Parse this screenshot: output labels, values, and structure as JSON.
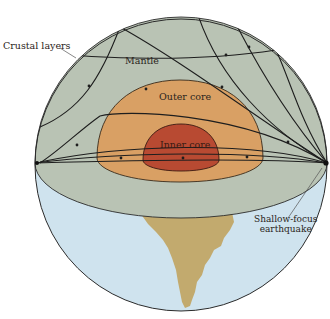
{
  "figure": {
    "labels": {
      "crustal_layers": "Crustal layers",
      "mantle": "Mantle",
      "outer_core": "Outer core",
      "inner_core": "Inner core",
      "earthquake_line1": "Shallow-focus",
      "earthquake_line2": "earthquake"
    },
    "colors": {
      "mantle": "#b9c3b4",
      "outer_core": "#d9a064",
      "inner_core": "#b84a32",
      "ocean": "#cfe3ee",
      "land": "#c2aa6e",
      "outline": "#2b2b2b",
      "ray": "#1e1e1e"
    },
    "components": [
      "crust",
      "mantle",
      "outer core",
      "inner core",
      "seismic ray paths",
      "earthquake focus",
      "South America landmass"
    ]
  }
}
